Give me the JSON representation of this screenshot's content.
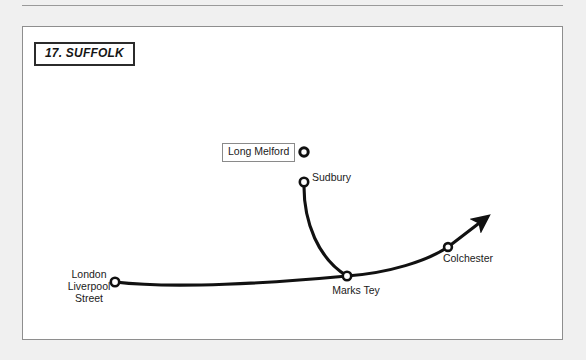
{
  "diagram": {
    "title": "17. SUFFOLK",
    "nodes": [
      {
        "id": "london",
        "label": "London\nLiverpool\nStreet",
        "label_lines": [
          "London",
          "Liverpool",
          "Street"
        ],
        "marker": "terminus-ring",
        "x": 114,
        "y": 281
      },
      {
        "id": "marks_tey",
        "label": "Marks Tey",
        "marker": "junction-ring",
        "x": 346,
        "y": 275
      },
      {
        "id": "colchester",
        "label": "Colchester",
        "marker": "through-ring",
        "x": 447,
        "y": 246
      },
      {
        "id": "sudbury",
        "label": "Sudbury",
        "marker": "terminus-ring",
        "x": 303,
        "y": 177
      },
      {
        "id": "long_melford",
        "label": "Long Melford",
        "marker": "boxed-ring",
        "x": 303,
        "y": 151
      }
    ],
    "routes": [
      {
        "id": "main-line",
        "from": "london",
        "via": [
          "marks_tey",
          "colchester"
        ],
        "continues": true,
        "arrow": true
      },
      {
        "id": "sudbury-branch",
        "from": "sudbury",
        "to": "marks_tey",
        "continues": false,
        "arrow": false
      }
    ],
    "colors": {
      "line": "#111111",
      "panel_border": "#8e8e8e",
      "page_background": "#f0f0f0",
      "panel_background": "#ffffff",
      "title_border": "#2b2b2b",
      "label_box_border": "#8a8a8a",
      "text": "#1a1a1a"
    }
  }
}
